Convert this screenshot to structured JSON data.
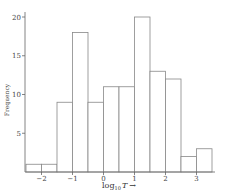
{
  "chart_data": {
    "type": "bar",
    "title": "",
    "xlabel": "log10 T →",
    "xlabel_base": "log",
    "xlabel_sub": "10",
    "xlabel_var": "T",
    "xlabel_arrow": "→",
    "ylabel": "Frequency",
    "bin_width": 0.5,
    "bin_edges": [
      -2.5,
      -2.0,
      -1.5,
      -1.0,
      -0.5,
      0.0,
      0.5,
      1.0,
      1.5,
      2.0,
      2.5,
      3.0,
      3.5
    ],
    "categories": [
      "-2.5 to -2.0",
      "-2.0 to -1.5",
      "-1.5 to -1.0",
      "-1.0 to -0.5",
      "-0.5 to 0.0",
      "0.0 to 0.5",
      "0.5 to 1.0",
      "1.0 to 1.5",
      "1.5 to 2.0",
      "2.0 to 2.5",
      "2.5 to 3.0",
      "3.0 to 3.5"
    ],
    "values": [
      1,
      1,
      9,
      18,
      9,
      11,
      11,
      20,
      13,
      12,
      2,
      3
    ],
    "xlim": [
      -2.5,
      3.75
    ],
    "ylim": [
      0,
      20
    ],
    "xticks": [
      -2,
      -1,
      0,
      1,
      2,
      3
    ],
    "xtick_labels": [
      "−2",
      "−1",
      "0",
      "1",
      "2",
      "3"
    ],
    "yticks": [
      5,
      10,
      15,
      20
    ],
    "ytick_labels": [
      "5",
      "10",
      "15",
      "20"
    ],
    "grid": false,
    "legend": null
  },
  "style": {
    "bar_stroke": "#888888",
    "bar_fill": "#ffffff",
    "axis_color": "#666666"
  }
}
